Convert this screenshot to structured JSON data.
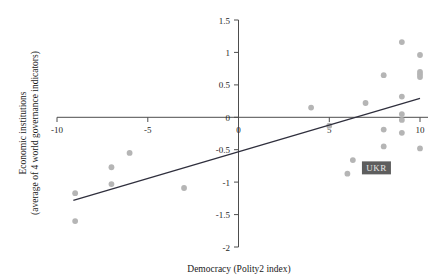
{
  "chart_data": {
    "type": "scatter",
    "title": "",
    "xlabel": "Democracy (Polity2 index)",
    "ylabel": "Economic institutions\n(average of 4 world governance indicators)",
    "ylabel_line1": "Economic institutions",
    "ylabel_line2": "(average of 4 world governance indicators)",
    "xlim": [
      -10,
      10
    ],
    "ylim": [
      -2,
      1.5
    ],
    "xticks": [
      -10,
      -5,
      0,
      5,
      10
    ],
    "xtick_labels": [
      "-10",
      "-5",
      "0",
      "5",
      "10"
    ],
    "yticks": [
      1.5,
      1,
      0.5,
      0,
      -0.5,
      -1,
      -1.5,
      -2
    ],
    "ytick_labels": [
      "1.5",
      "1",
      "0.5",
      "0",
      "-0.5",
      "-1",
      "-1.5",
      "-2"
    ],
    "grid": false,
    "legend": false,
    "point_color": "#b5b5b5",
    "line_color": "#2f2f3d",
    "points": [
      {
        "x": -9.0,
        "y": -1.17
      },
      {
        "x": -9.0,
        "y": -1.6
      },
      {
        "x": -7.0,
        "y": -0.77
      },
      {
        "x": -7.0,
        "y": -1.03
      },
      {
        "x": -6.0,
        "y": -0.55
      },
      {
        "x": -3.0,
        "y": -1.09
      },
      {
        "x": 4.0,
        "y": 0.15
      },
      {
        "x": 5.0,
        "y": -0.13
      },
      {
        "x": 6.0,
        "y": -0.87
      },
      {
        "x": 6.3,
        "y": -0.66
      },
      {
        "x": 7.0,
        "y": 0.22
      },
      {
        "x": 8.0,
        "y": 0.65
      },
      {
        "x": 8.0,
        "y": -0.19
      },
      {
        "x": 8.0,
        "y": -0.45
      },
      {
        "x": 9.0,
        "y": 1.16
      },
      {
        "x": 9.0,
        "y": 0.32
      },
      {
        "x": 9.0,
        "y": 0.05
      },
      {
        "x": 9.0,
        "y": -0.04
      },
      {
        "x": 9.0,
        "y": -0.24
      },
      {
        "x": 10.0,
        "y": 0.96
      },
      {
        "x": 10.0,
        "y": 0.7
      },
      {
        "x": 10.0,
        "y": 0.66
      },
      {
        "x": 10.0,
        "y": 0.62
      },
      {
        "x": 10.0,
        "y": -0.48
      }
    ],
    "trend_line": {
      "x0": -9.1,
      "y0": -1.28,
      "x1": 10.0,
      "y1": 0.29
    },
    "annotations": [
      {
        "label": "UKR",
        "x": 7.6,
        "y": -0.78,
        "style": "dark-box"
      }
    ]
  }
}
